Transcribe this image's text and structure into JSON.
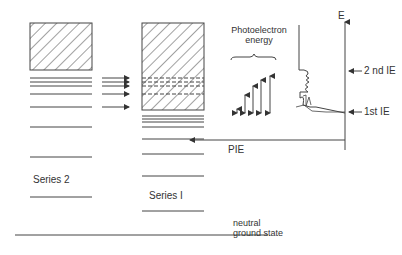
{
  "diagram": {
    "colors": {
      "line": "#444444",
      "background": "#ffffff"
    },
    "series2": {
      "label": "Series 2",
      "continuum": {
        "x": 30,
        "y": 23,
        "w": 62,
        "h": 47,
        "hatched": true
      },
      "levels_y": [
        78,
        82,
        86,
        94,
        107,
        127,
        157,
        197
      ]
    },
    "series1": {
      "label": "Series I",
      "continuum": {
        "x": 142,
        "y": 23,
        "w": 62,
        "h": 87,
        "hatched": true
      },
      "dashed_levels_y": [
        78,
        82,
        86,
        94
      ],
      "levels_y": [
        116,
        119,
        122,
        127,
        139,
        154,
        176,
        211
      ]
    },
    "transfer_arrows_y": [
      78,
      82,
      86,
      94,
      107
    ],
    "ground_state": {
      "label_line1": "neutral",
      "label_line2": "ground state",
      "y": 235
    },
    "photoelectron": {
      "label_line1": "Photoelectron",
      "label_line2": "energy",
      "arrows": [
        {
          "x": 237,
          "top": 109
        },
        {
          "x": 245,
          "top": 95
        },
        {
          "x": 253,
          "top": 86
        },
        {
          "x": 261,
          "top": 80
        },
        {
          "x": 270,
          "top": 76
        }
      ]
    },
    "energy_axis": {
      "label": "E"
    },
    "ionization": {
      "second_ie_label": "2 nd  IE",
      "first_ie_label": "1st  IE"
    },
    "pie_label": "PIE"
  }
}
